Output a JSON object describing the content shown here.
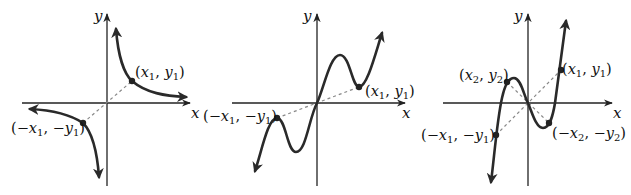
{
  "figure": {
    "graphs": [
      {
        "id": "graph-1",
        "shape": "hyperbola-like, two branches in quadrants I and III",
        "axis_labels": {
          "x": "x",
          "y": "y"
        },
        "points": [
          {
            "label_open": "(",
            "var1": "x",
            "sub1": "1",
            "sep": ", ",
            "var2": "y",
            "sub2": "1",
            "label_close": ")",
            "neg": false
          },
          {
            "label_open": "(−",
            "var1": "x",
            "sub1": "1",
            "sep": ", −",
            "var2": "y",
            "sub2": "1",
            "label_close": ")",
            "neg": true
          }
        ]
      },
      {
        "id": "graph-2",
        "shape": "oscillating curve through origin, rising overall",
        "axis_labels": {
          "x": "x",
          "y": "y"
        },
        "points": [
          {
            "label_open": "(",
            "var1": "x",
            "sub1": "1",
            "sep": ", ",
            "var2": "y",
            "sub2": "1",
            "label_close": ")",
            "neg": false
          },
          {
            "label_open": "(−",
            "var1": "x",
            "sub1": "1",
            "sep": ", −",
            "var2": "y",
            "sub2": "1",
            "label_close": ")",
            "neg": true
          }
        ]
      },
      {
        "id": "graph-3",
        "shape": "cubic curve through origin with local max and min",
        "axis_labels": {
          "x": "x",
          "y": "y"
        },
        "points": [
          {
            "label_open": "(",
            "var1": "x",
            "sub1": "1",
            "sep": ", ",
            "var2": "y",
            "sub2": "1",
            "label_close": ")",
            "neg": false
          },
          {
            "label_open": "(",
            "var1": "x",
            "sub1": "2",
            "sep": ", ",
            "var2": "y",
            "sub2": "2",
            "label_close": ")",
            "neg": false
          },
          {
            "label_open": "(−",
            "var1": "x",
            "sub1": "1",
            "sep": ", −",
            "var2": "y",
            "sub2": "1",
            "label_close": ")",
            "neg": true
          },
          {
            "label_open": "(−",
            "var1": "x",
            "sub1": "2",
            "sep": ", −",
            "var2": "y",
            "sub2": "2",
            "label_close": ")",
            "neg": true
          }
        ]
      }
    ]
  }
}
